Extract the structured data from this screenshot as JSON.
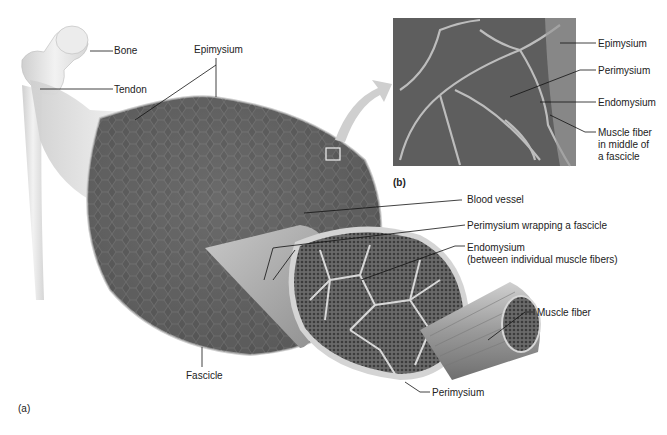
{
  "figure": {
    "panels": {
      "a": {
        "label": "(a)"
      },
      "b": {
        "label": "(b)"
      }
    },
    "labels_a": {
      "bone": "Bone",
      "tendon": "Tendon",
      "epimysium": "Epimysium",
      "blood_vessel": "Blood vessel",
      "perimysium_wrapping": "Perimysium wrapping a fascicle",
      "endomysium": "Endomysium",
      "endomysium_note": "(between individual muscle fibers)",
      "muscle_fiber": "Muscle fiber",
      "fascicle": "Fascicle",
      "perimysium": "Perimysium"
    },
    "labels_b": {
      "epimysium": "Epimysium",
      "perimysium": "Perimysium",
      "endomysium": "Endomysium",
      "muscle_fiber_line1": "Muscle fiber",
      "muscle_fiber_line2": "in middle of",
      "muscle_fiber_line3": "a fascicle"
    },
    "colors": {
      "muscle_dark": "#555555",
      "muscle_mid": "#7a7a7a",
      "connective": "#d8d8d8",
      "bone": "#e8e8e8",
      "leader_line": "#111111"
    }
  }
}
